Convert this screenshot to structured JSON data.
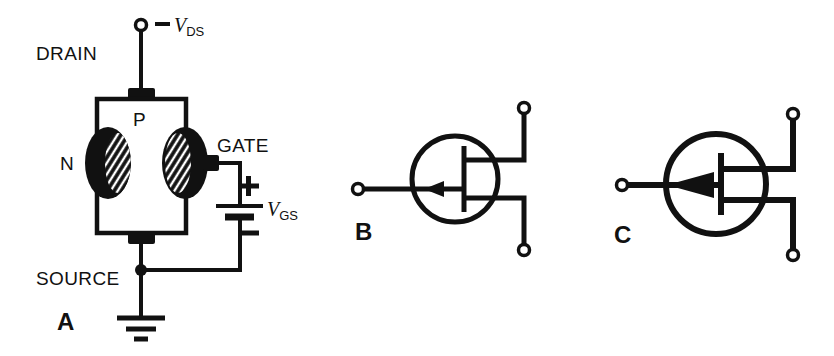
{
  "figure": {
    "background_color": "#ffffff",
    "ink_color": "#111111",
    "panels": [
      {
        "id": "A",
        "label": "A",
        "kind": "construction-diagram",
        "labels": {
          "drain": "DRAIN",
          "source": "SOURCE",
          "gate": "GATE",
          "channel_region": "P",
          "gate_region": "N",
          "supply_drain": "V",
          "supply_drain_sub": "DS",
          "supply_drain_sign": "−",
          "supply_gate": "V",
          "supply_gate_sub": "GS",
          "battery_plus": "+",
          "battery_minus": "−"
        }
      },
      {
        "id": "B",
        "label": "B",
        "kind": "schematic-symbol",
        "description": "P-channel JFET symbol, thin gate arrow"
      },
      {
        "id": "C",
        "label": "C",
        "kind": "schematic-symbol",
        "description": "P-channel JFET symbol, solid gate arrow"
      }
    ]
  }
}
